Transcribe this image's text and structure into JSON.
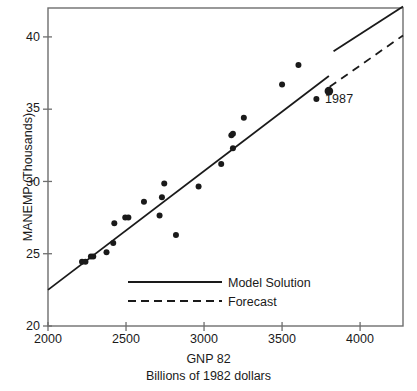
{
  "chart_data": {
    "type": "scatter",
    "title": "",
    "xlabel": "GNP 82",
    "xlabel_sub": "Billions of 1982 dollars",
    "ylabel": "MANEMP (Thousands)",
    "xlim": [
      2000,
      4275
    ],
    "ylim": [
      20,
      42
    ],
    "xticks": [
      2000,
      2500,
      3000,
      3500,
      4000
    ],
    "xticklabels": [
      "2000",
      "2500",
      "3000",
      "3500",
      "4000"
    ],
    "yticks": [
      20,
      25,
      30,
      35,
      40
    ],
    "yticklabels": [
      "20",
      "25",
      "30",
      "35",
      "40"
    ],
    "grid": false,
    "legend_position": "lower-center",
    "legend": [
      {
        "label": "Model Solution",
        "style": "solid"
      },
      {
        "label": "Forecast",
        "style": "dashed"
      }
    ],
    "annotations": [
      {
        "text": "1987",
        "x": 3830,
        "y": 35.9
      }
    ],
    "series": [
      {
        "name": "Observations",
        "type": "scatter",
        "marker": "filled-circle",
        "color": "#1a1a1a",
        "points": [
          {
            "x": 2218,
            "y": 24.45
          },
          {
            "x": 2240,
            "y": 24.45
          },
          {
            "x": 2275,
            "y": 24.8
          },
          {
            "x": 2290,
            "y": 24.8
          },
          {
            "x": 2375,
            "y": 25.1
          },
          {
            "x": 2418,
            "y": 25.75
          },
          {
            "x": 2425,
            "y": 27.1
          },
          {
            "x": 2495,
            "y": 27.5
          },
          {
            "x": 2515,
            "y": 27.5
          },
          {
            "x": 2615,
            "y": 28.6
          },
          {
            "x": 2715,
            "y": 27.65
          },
          {
            "x": 2730,
            "y": 28.9
          },
          {
            "x": 2745,
            "y": 29.85
          },
          {
            "x": 2820,
            "y": 26.3
          },
          {
            "x": 2965,
            "y": 29.65
          },
          {
            "x": 3110,
            "y": 31.2
          },
          {
            "x": 3175,
            "y": 33.2
          },
          {
            "x": 3185,
            "y": 33.3
          },
          {
            "x": 3185,
            "y": 32.3
          },
          {
            "x": 3255,
            "y": 34.4
          },
          {
            "x": 3500,
            "y": 36.7
          },
          {
            "x": 3605,
            "y": 38.05
          },
          {
            "x": 3720,
            "y": 35.7
          }
        ]
      },
      {
        "name": "Observation 1987",
        "type": "scatter",
        "marker": "filled-circle-large",
        "color": "#1a1a1a",
        "points": [
          {
            "x": 3800,
            "y": 36.25
          }
        ]
      },
      {
        "name": "Model Solution",
        "type": "line",
        "style": "solid",
        "color": "#1a1a1a",
        "segments": [
          [
            {
              "x": 2000,
              "y": 22.5
            },
            {
              "x": 3800,
              "y": 37.3
            }
          ],
          [
            {
              "x": 3830,
              "y": 39.0
            },
            {
              "x": 4275,
              "y": 42.1
            }
          ]
        ]
      },
      {
        "name": "Forecast",
        "type": "line",
        "style": "dashed",
        "color": "#1a1a1a",
        "segments": [
          [
            {
              "x": 3805,
              "y": 36.55
            },
            {
              "x": 4275,
              "y": 40.1
            }
          ]
        ]
      }
    ]
  },
  "legend_items": {
    "model_solution": "Model Solution",
    "forecast": "Forecast"
  },
  "ticks": {
    "y": [
      "40",
      "35",
      "30",
      "25",
      "20"
    ],
    "x": [
      "2000",
      "2500",
      "3000",
      "3500",
      "4000"
    ]
  },
  "labels": {
    "y_axis": "MANEMP (Thousands)",
    "x_axis": "GNP 82",
    "x_axis_sub": "Billions of 1982 dollars",
    "annotation_1987": "1987"
  },
  "colors": {
    "ink": "#1a1a1a",
    "frame": "#6e6e6e",
    "background": "#ffffff"
  }
}
